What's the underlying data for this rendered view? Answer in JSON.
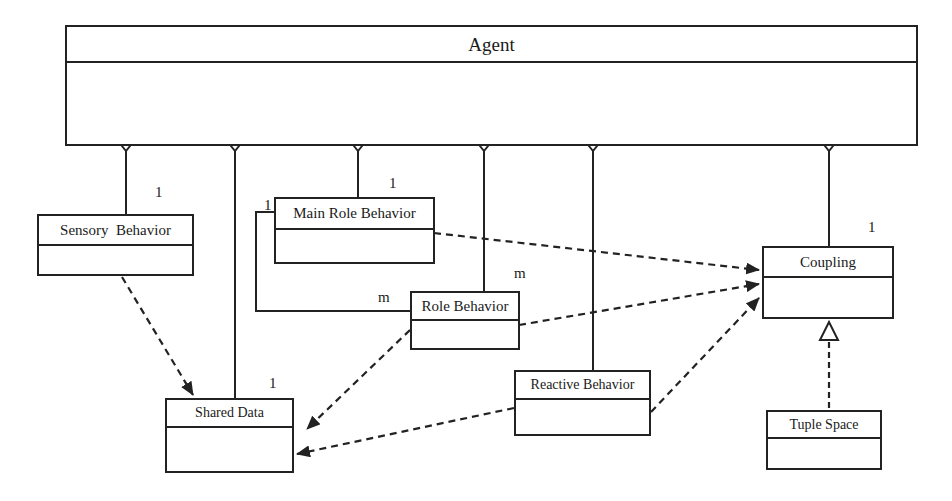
{
  "diagram": {
    "type": "UML class diagram",
    "classes": [
      {
        "id": "agent",
        "name": "Agent"
      },
      {
        "id": "sensory",
        "name": "Sensory  Behavior"
      },
      {
        "id": "main_role",
        "name": "Main Role Behavior"
      },
      {
        "id": "role",
        "name": "Role Behavior"
      },
      {
        "id": "shared",
        "name": "Shared Data"
      },
      {
        "id": "reactive",
        "name": "Reactive Behavior"
      },
      {
        "id": "coupling",
        "name": "Coupling"
      },
      {
        "id": "tuple",
        "name": "Tuple Space"
      }
    ],
    "multiplicities": {
      "sensory": "1",
      "main_role_top": "1",
      "main_role_left": "1",
      "role_from_main": "m",
      "role_from_agent": "m",
      "shared": "1",
      "coupling": "1"
    },
    "relations": [
      {
        "kind": "aggregation",
        "whole": "Agent",
        "part": "Sensory Behavior",
        "multiplicity": "1"
      },
      {
        "kind": "aggregation",
        "whole": "Agent",
        "part": "Shared Data",
        "multiplicity": "1"
      },
      {
        "kind": "aggregation",
        "whole": "Agent",
        "part": "Main Role Behavior",
        "multiplicity": "1"
      },
      {
        "kind": "aggregation",
        "whole": "Agent",
        "part": "Role Behavior",
        "multiplicity": "m"
      },
      {
        "kind": "aggregation",
        "whole": "Agent",
        "part": "Reactive Behavior"
      },
      {
        "kind": "aggregation",
        "whole": "Agent",
        "part": "Coupling",
        "multiplicity": "1"
      },
      {
        "kind": "association",
        "from": "Main Role Behavior",
        "to": "Role Behavior",
        "multiplicity_from": "1",
        "multiplicity_to": "m"
      },
      {
        "kind": "dependency",
        "from": "Sensory Behavior",
        "to": "Shared Data"
      },
      {
        "kind": "dependency",
        "from": "Role Behavior",
        "to": "Shared Data"
      },
      {
        "kind": "dependency",
        "from": "Reactive Behavior",
        "to": "Shared Data"
      },
      {
        "kind": "dependency",
        "from": "Main Role Behavior",
        "to": "Coupling"
      },
      {
        "kind": "dependency",
        "from": "Role Behavior",
        "to": "Coupling"
      },
      {
        "kind": "dependency",
        "from": "Reactive Behavior",
        "to": "Coupling"
      },
      {
        "kind": "realization",
        "from": "Tuple Space",
        "to": "Coupling"
      }
    ]
  }
}
